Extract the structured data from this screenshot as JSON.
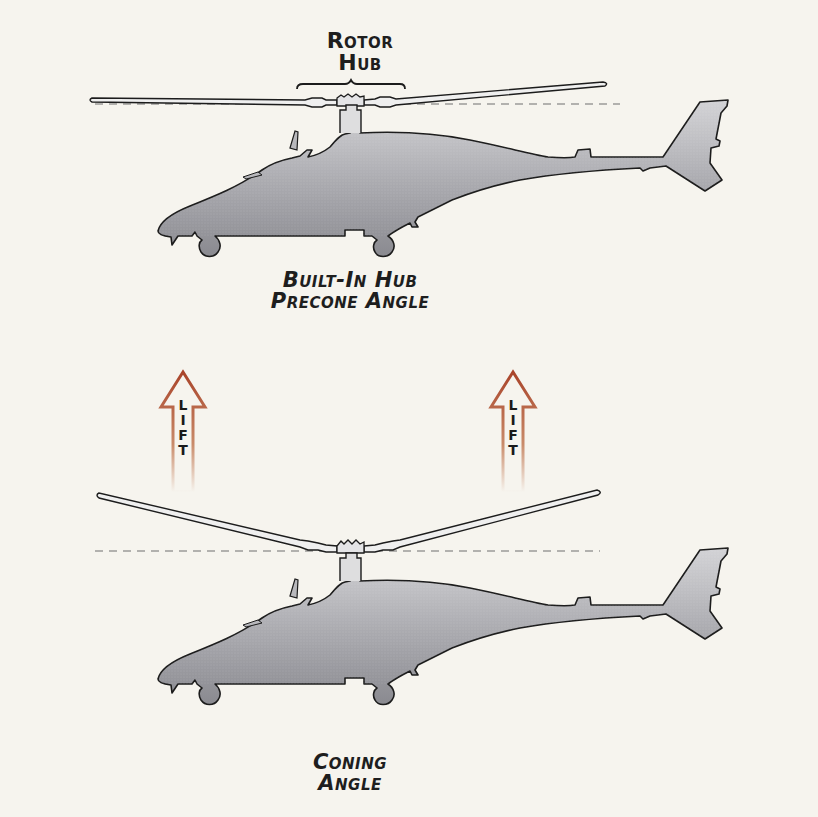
{
  "diagram": {
    "colors": {
      "background": "#f6f4ee",
      "fuselage_fill_light": "#c9c9cc",
      "fuselage_fill_dark": "#8e8e94",
      "outline": "#1c1c1c",
      "lift_arrow": "#b05a36",
      "reference_line": "#6e6e6e"
    },
    "top_figure": {
      "callout_label": [
        "Rotor",
        "Hub"
      ],
      "caption": [
        "Built-In Hub",
        "Precone Angle"
      ],
      "rotor_state": "flat blades with slight built-in precone"
    },
    "lift_arrows": [
      {
        "letters": [
          "L",
          "I",
          "F",
          "T"
        ]
      },
      {
        "letters": [
          "L",
          "I",
          "F",
          "T"
        ]
      }
    ],
    "bottom_figure": {
      "caption": [
        "Coning",
        "Angle"
      ],
      "rotor_state": "blades coned upward under lift"
    }
  }
}
